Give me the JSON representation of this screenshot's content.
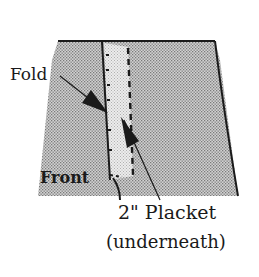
{
  "diagram": {
    "labels": {
      "fold": "Fold",
      "front": "Front",
      "placket": "2\"  Placket",
      "underneath": "(underneath)"
    },
    "colors": {
      "fabric_fill": "#c8c8c8",
      "fabric_dots": "#8a8a8a",
      "placket_strip": "#e4e4e4",
      "outline": "#1a1a1a",
      "background": "#ffffff"
    }
  }
}
